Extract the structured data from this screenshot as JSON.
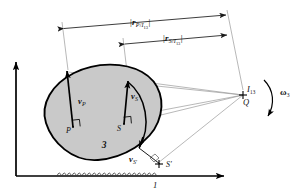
{
  "figure": {
    "body_label": "3",
    "ground_label": "1",
    "colors": {
      "body_fill": "#c9c9c9",
      "body_stroke": "#000000",
      "vector_stroke": "#000000",
      "construction_line": "#8c8c8c",
      "dimension_line": "#5a5a5a",
      "axis": "#000000",
      "text": "#111111"
    }
  },
  "dimensions": [
    {
      "id": "dim-rp",
      "label_prefix": "|",
      "label_var": "r",
      "label_sub": "P/I",
      "label_subsub": "13",
      "label_suffix": "|",
      "full_label": "|r_P/I13|"
    },
    {
      "id": "dim-rs",
      "label_prefix": "|",
      "label_var": "r",
      "label_sub": "S/I",
      "label_subsub": "13",
      "label_suffix": "|",
      "full_label": "|r_S/I13|"
    }
  ],
  "points": [
    {
      "id": "point-p",
      "label": "P",
      "prime": ""
    },
    {
      "id": "point-s",
      "label": "S",
      "prime": ""
    },
    {
      "id": "point-s-prime",
      "label": "S",
      "prime": "′"
    },
    {
      "id": "point-q",
      "label": "Q",
      "prime": ""
    },
    {
      "id": "point-i13",
      "label": "I",
      "sub": "13"
    }
  ],
  "vectors": [
    {
      "id": "vector-vp",
      "label_var": "v",
      "label_sub": "P",
      "full_label": "v_P"
    },
    {
      "id": "vector-vs",
      "label_var": "v",
      "label_sub": "S",
      "full_label": "v_S"
    },
    {
      "id": "vector-vs-prime",
      "label_var": "v",
      "label_sub": "S′",
      "full_label": "v_S'"
    }
  ],
  "angular_velocity": {
    "id": "omega-3",
    "symbol": "ω",
    "subscript": "3",
    "full_label": "ω3"
  },
  "axes": {
    "horizontal_label": "1",
    "vertical_label": ""
  }
}
